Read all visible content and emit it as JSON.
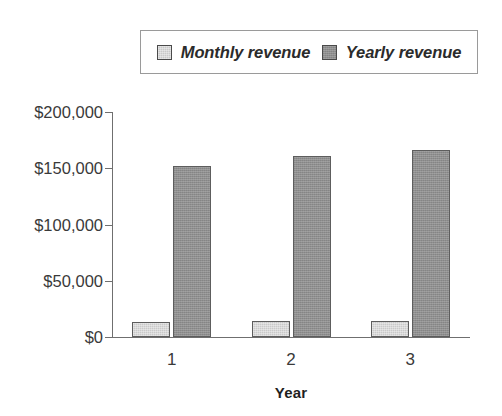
{
  "chart_data": {
    "type": "bar",
    "title": "",
    "subtitle": "",
    "xlabel": "Year",
    "ylabel": "",
    "categories": [
      "1",
      "2",
      "3"
    ],
    "series": [
      {
        "name": "Monthly revenue",
        "values": [
          13000,
          14000,
          14000
        ],
        "color": "#c9c9c9"
      },
      {
        "name": "Yearly revenue",
        "values": [
          152000,
          161000,
          166000
        ],
        "color": "#8f8f8f"
      }
    ],
    "ylim": [
      0,
      200000
    ],
    "ytick_values": [
      0,
      50000,
      100000,
      150000,
      200000
    ],
    "ytick_labels": [
      "$0",
      "$50,000",
      "$100,000",
      "$150,000",
      "$200,000"
    ],
    "grid": false,
    "legend_position": "top",
    "bar_outline_color": "#5d5d5d",
    "axis_color": "#6f6f6f",
    "background": "#ffffff"
  },
  "legend": {
    "entries": [
      {
        "label": "Monthly revenue",
        "swatch": "light"
      },
      {
        "label": "Yearly revenue",
        "swatch": "dark"
      }
    ]
  },
  "axes": {
    "x_title": "Year"
  }
}
